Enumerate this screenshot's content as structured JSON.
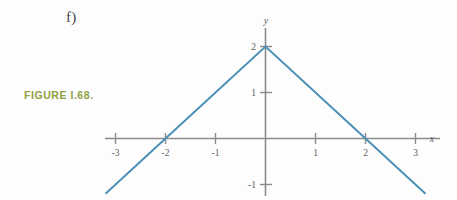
{
  "page": {
    "background_color": "#fdfdfd",
    "width": 457,
    "height": 200
  },
  "part_label": "f)",
  "caption": {
    "text": "FIGURE I.68.",
    "color": "#8fa03f"
  },
  "chart_data": {
    "type": "line",
    "title": "",
    "subtitle": "",
    "xlabel": "x",
    "ylabel": "y",
    "xlim": [
      -3.2,
      3.5
    ],
    "ylim": [
      -1.15,
      2.3
    ],
    "xticks": [
      -3,
      -2,
      -1,
      1,
      2,
      3
    ],
    "xticklabels": [
      "-3",
      "-2",
      "-1",
      "1",
      "2",
      "3"
    ],
    "yticks": [
      1,
      2,
      -1
    ],
    "yticklabels": [
      "1",
      "2",
      "-1"
    ],
    "grid": false,
    "legend": null,
    "axis_color": "#8c8c8c",
    "series": [
      {
        "name": "y = 2 - |x|",
        "color": "#4a8fb5",
        "x": [
          -3.2,
          -2,
          0,
          2,
          3.2
        ],
        "y": [
          -1.2,
          0,
          2,
          0,
          -1.2
        ]
      }
    ],
    "annotations": [
      {
        "label": "apex",
        "x": 0,
        "y": 2
      },
      {
        "label": "x-intercept-left",
        "x": -2,
        "y": 0
      },
      {
        "label": "x-intercept-right",
        "x": 2,
        "y": 0
      }
    ],
    "tick_labels_x": {
      "t_-3": "-3",
      "t_-2": "-2",
      "t_-1": "-1",
      "t_1": "1",
      "t_2": "2",
      "t_3": "3"
    },
    "tick_labels_y": {
      "t_2": "2",
      "t_1": "1",
      "t_-1": "-1"
    }
  }
}
